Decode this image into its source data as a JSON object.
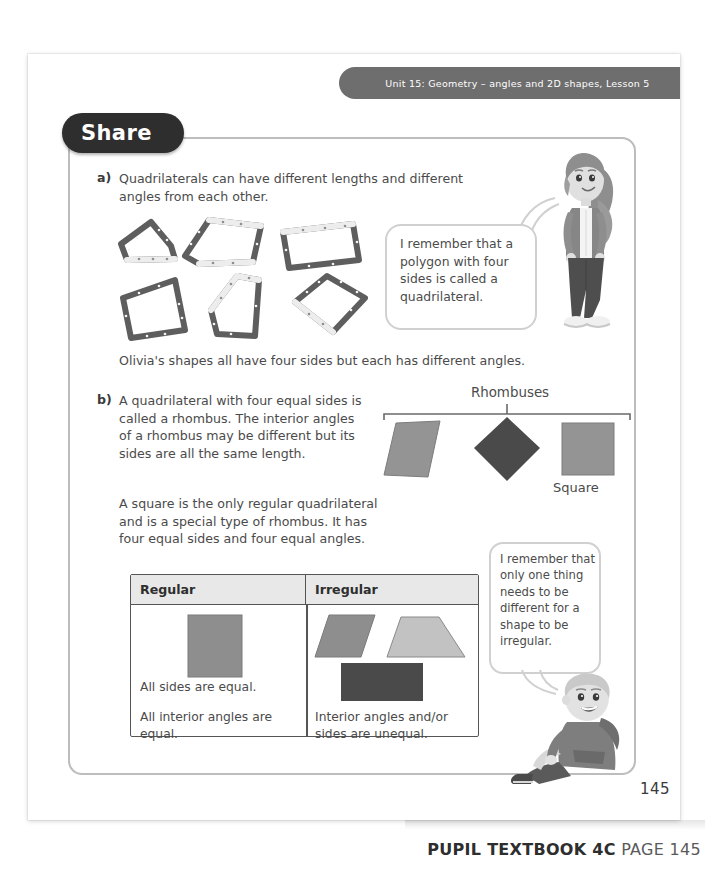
{
  "header": {
    "unit_banner": "Unit 15: Geometry – angles and 2D shapes, Lesson 5"
  },
  "section": {
    "title": "Share"
  },
  "parts": {
    "a": {
      "marker": "a)",
      "text": "Quadrilaterals can have different lengths and different angles from each other.",
      "caption_below": "Olivia's shapes all have four sides but each has different angles."
    },
    "b": {
      "marker": "b)",
      "text": "A quadrilateral with four equal sides is called a rhombus. The interior angles of a rhombus may be different but its sides are all the same length.",
      "text2": "A square is the only regular quadrilateral and is a special type of rhombus. It has four equal sides and four equal angles."
    }
  },
  "speech_bubbles": [
    {
      "speaker": "girl",
      "text": "I remember that a polygon with four sides is called a quadrilateral."
    },
    {
      "speaker": "boy",
      "text": "I remember that only one thing needs to be different for a shape to be irregular."
    }
  ],
  "rhombus_diagram": {
    "bracket_label": "Rhombuses",
    "square_label": "Square",
    "shapes": [
      {
        "name": "slanted-parallelogram-rhombus",
        "fill": "#949494"
      },
      {
        "name": "diamond-rhombus",
        "fill": "#4a4a4a"
      },
      {
        "name": "square-rhombus",
        "fill": "#949494"
      }
    ]
  },
  "shape_table": {
    "headers": [
      "Regular",
      "Irregular"
    ],
    "regular_cell": {
      "shape": {
        "name": "grey-square",
        "fill": "#8e8e8e"
      },
      "lines": [
        "All sides are equal.",
        "All interior angles are equal."
      ]
    },
    "irregular_cell": {
      "shapes": [
        {
          "name": "grey-parallelogram",
          "fill": "#8e8e8e"
        },
        {
          "name": "light-grey-trapezium",
          "fill": "#c2c2c2"
        },
        {
          "name": "dark-grey-rectangle",
          "fill": "#4a4a4a"
        }
      ],
      "lines": [
        "Interior angles and/or sides are unequal."
      ]
    }
  },
  "footer": {
    "page_number": "145",
    "caption_bold": "PUPIL TEXTBOOK 4C",
    "caption_light": "PAGE 145"
  },
  "colors": {
    "banner_grey": "#6e6e6e",
    "pill_dark": "#2e2e2e",
    "body_text": "#4b4b4b",
    "frame_border": "#bdbdbd"
  }
}
